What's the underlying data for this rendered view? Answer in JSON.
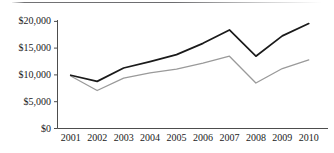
{
  "chart_data": {
    "type": "line",
    "title": "",
    "subtitle": "",
    "xlabel": "",
    "ylabel": "",
    "categories": [
      "2001",
      "2002",
      "2003",
      "2004",
      "2005",
      "2006",
      "2007",
      "2008",
      "2009",
      "2010"
    ],
    "x": [
      2001,
      2002,
      2003,
      2004,
      2005,
      2006,
      2007,
      2008,
      2009,
      2010
    ],
    "ylim": [
      0,
      20000
    ],
    "ytick_values": [
      0,
      5000,
      10000,
      15000,
      20000
    ],
    "ytick_labels": [
      "$0",
      "$5,000",
      "$10,000",
      "$15,000",
      "$20,000"
    ],
    "xtick_labels": [
      "2001",
      "2002",
      "2003",
      "2004",
      "2005",
      "2006",
      "2007",
      "2008",
      "2009",
      "2010"
    ],
    "grid": false,
    "legend": "none",
    "annotations": [],
    "series": [
      {
        "name": "upper-series",
        "color": "#1a1a1a",
        "line_width": 1.7,
        "values": [
          9950,
          8800,
          11300,
          12500,
          13800,
          15900,
          18400,
          13500,
          17300,
          19600
        ]
      },
      {
        "name": "lower-series",
        "color": "#9a9a9a",
        "line_width": 1.3,
        "values": [
          9800,
          7100,
          9400,
          10400,
          11100,
          12200,
          13500,
          8500,
          11200,
          12800
        ]
      }
    ]
  },
  "axis": {
    "axis_color": "#4d4d4d",
    "tick_color": "#4d4d4d"
  },
  "decoration": {
    "top_rule_color": "#5c5c5f"
  }
}
